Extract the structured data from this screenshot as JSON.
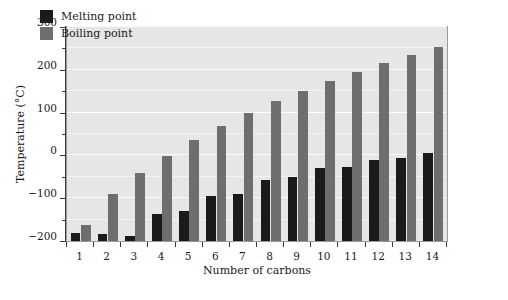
{
  "chart_data": {
    "type": "bar",
    "title": "",
    "subtitle": "",
    "xlabel": "Number of carbons",
    "ylabel": "Temperature (°C)",
    "categories": [
      "1",
      "2",
      "3",
      "4",
      "5",
      "6",
      "7",
      "8",
      "9",
      "10",
      "11",
      "12",
      "13",
      "14"
    ],
    "series": [
      {
        "name": "Melting point",
        "color": "#1a1a1a",
        "values": [
          -182,
          -183,
          -188,
          -138,
          -130,
          -95,
          -91,
          -57,
          -51,
          -30,
          -26,
          -10,
          -6,
          6
        ]
      },
      {
        "name": "Boiling point",
        "color": "#6e6e6e",
        "values": [
          -162,
          -89,
          -42,
          -0.5,
          36,
          69,
          98,
          126,
          151,
          174,
          196,
          216,
          235,
          253
        ]
      }
    ],
    "ylim": [
      -200,
      300
    ],
    "ytick_values": [
      300,
      200,
      100,
      0,
      -100,
      -200
    ],
    "ytick_labels": [
      "300",
      "200",
      "100",
      "0",
      "−100",
      "−200"
    ],
    "yminor_values": [
      250,
      150,
      50,
      -50,
      -150
    ],
    "gridlines": "horizontal-white",
    "baseline": -200,
    "legend_position": "top-left-inside",
    "panel_color": "#e6e6e6",
    "grid_color": "#f7f7f7",
    "axis_color": "#3b3b3b"
  },
  "legend": {
    "items": [
      {
        "label": "Melting point",
        "color": "#1a1a1a"
      },
      {
        "label": "Boiling point",
        "color": "#6e6e6e"
      }
    ]
  },
  "axes": {
    "y_title": "Temperature (°C)",
    "x_title": "Number of carbons"
  }
}
